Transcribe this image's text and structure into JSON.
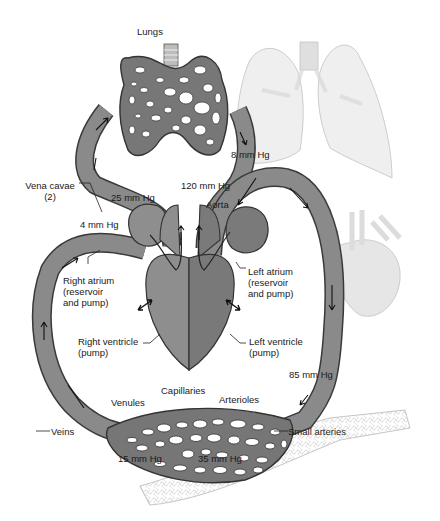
{
  "diagram": {
    "colors": {
      "vessel": "#8a8a8a",
      "vessel_stroke": "#3a3a3a",
      "heart_right": "#8e8e8e",
      "heart_left": "#7a7a7a",
      "faded_illustration": "#d8d8d8",
      "background": "#ffffff"
    },
    "labels": {
      "lungs": "Lungs",
      "vena_cavae": "Vena cavae\n(2)",
      "p_25": "25 mm Hg",
      "p_120": "120 mm Hg",
      "p_8": "8 mm Hg",
      "p_4": "4 mm Hg",
      "aorta": "Aorta",
      "right_atrium": "Right atrium\n(reservoir\nand pump)",
      "left_atrium": "Left atrium\n(reservoir\nand pump)",
      "right_ventricle": "Right ventricle\n(pump)",
      "left_ventricle": "Left ventricle\n(pump)",
      "p_85": "85 mm Hg",
      "capillaries": "Capillaries",
      "venules": "Venules",
      "arterioles": "Arterioles",
      "veins": "Veins",
      "small_arteries": "Small arteries",
      "p_15": "15 mm Hg",
      "p_35": "35 mm Hg"
    }
  }
}
